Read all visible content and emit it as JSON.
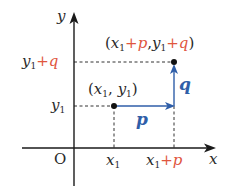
{
  "diagram": {
    "type": "vector-translation-coordinate-plane",
    "axes": {
      "x_label": "x",
      "y_label": "y",
      "origin_label": "O"
    },
    "points": [
      {
        "name": "start",
        "label": "(x1, y1)",
        "x_label": "x1",
        "y_label": "y1"
      },
      {
        "name": "end",
        "label": "(x1+p, y1+q)",
        "x_label": "x1+p",
        "y_label": "y1+q"
      }
    ],
    "vectors": [
      {
        "name": "p",
        "label": "p",
        "direction": "horizontal"
      },
      {
        "name": "q",
        "label": "q",
        "direction": "vertical"
      }
    ],
    "colors": {
      "axis": "#1a1a1a",
      "vector": "#2f5ea8",
      "increment": "#e0563e",
      "dashed": "#333333"
    },
    "text": {
      "x": "x",
      "y": "y",
      "O": "O",
      "sub1": "1",
      "plus": "+",
      "p": "p",
      "q": "q",
      "lparen": "(",
      "rparen": ")",
      "comma": ","
    }
  }
}
